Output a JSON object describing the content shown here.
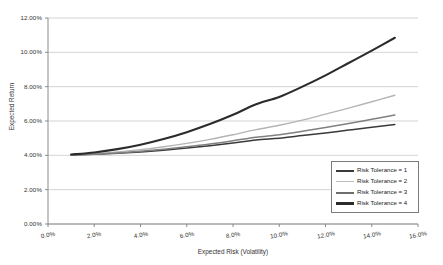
{
  "chart_data": {
    "type": "line",
    "title": "",
    "xlabel": "Expected Risk (Volatility)",
    "ylabel": "Expected Return",
    "xlim": [
      0,
      16
    ],
    "ylim": [
      0,
      12
    ],
    "xticks": [
      "0.0%",
      "2.0%",
      "4.0%",
      "6.0%",
      "8.0%",
      "10.0%",
      "12.0%",
      "14.0%",
      "16.0%"
    ],
    "yticks": [
      "0.00%",
      "2.00%",
      "4.00%",
      "6.00%",
      "8.00%",
      "10.00%",
      "12.00%"
    ],
    "grid": "horizontal",
    "legend_position": "bottom-right",
    "x": [
      1,
      2,
      3,
      4,
      5,
      6,
      7,
      8,
      9,
      10,
      11,
      12,
      13,
      14,
      15
    ],
    "series": [
      {
        "name": "Risk Tolerance = 1",
        "color": "#3a3a3a",
        "width": 1.5,
        "values": [
          4.02,
          4.06,
          4.12,
          4.2,
          4.3,
          4.42,
          4.56,
          4.72,
          4.9,
          5.0,
          5.15,
          5.3,
          5.47,
          5.63,
          5.8
        ]
      },
      {
        "name": "Risk Tolerance = 2",
        "color": "#b4b4b4",
        "width": 1.4,
        "values": [
          4.03,
          4.1,
          4.2,
          4.33,
          4.5,
          4.7,
          4.93,
          5.2,
          5.5,
          5.75,
          6.05,
          6.4,
          6.75,
          7.12,
          7.5
        ]
      },
      {
        "name": "Risk Tolerance = 3",
        "color": "#808080",
        "width": 1.5,
        "values": [
          4.02,
          4.07,
          4.14,
          4.24,
          4.36,
          4.5,
          4.66,
          4.85,
          5.05,
          5.2,
          5.4,
          5.62,
          5.85,
          6.1,
          6.35
        ]
      },
      {
        "name": "Risk Tolerance = 4",
        "color": "#2b2b2b",
        "width": 2.1,
        "values": [
          4.05,
          4.17,
          4.36,
          4.62,
          4.95,
          5.35,
          5.82,
          6.36,
          6.97,
          7.4,
          8.0,
          8.66,
          9.38,
          10.1,
          10.85
        ]
      }
    ],
    "legend": [
      {
        "label": "Risk Tolerance = 1",
        "color": "#3a3a3a",
        "thickness": "2px"
      },
      {
        "label": "Risk Tolerance = 2",
        "color": "#bdbdbd",
        "thickness": "1.5px"
      },
      {
        "label": "Risk Tolerance = 3",
        "color": "#6e6e6e",
        "thickness": "2px"
      },
      {
        "label": "Risk Tolerance = 4",
        "color": "#2b2b2b",
        "thickness": "2.5px"
      }
    ],
    "axis_color": "#808080",
    "grid_color": "#c8c8c8"
  }
}
